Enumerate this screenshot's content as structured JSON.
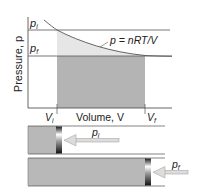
{
  "diagram": {
    "y_axis_label": "Pressure, p",
    "x_axis_label": "Volume, V",
    "pressure_initial_label": {
      "main": "p",
      "sub": "i"
    },
    "pressure_final_label": {
      "main": "p",
      "sub": "f"
    },
    "volume_initial_label": {
      "main": "V",
      "sub": "i"
    },
    "volume_final_label": {
      "main": "V",
      "sub": "f"
    },
    "curve_label": "p = nRT/V",
    "piston_initial_pressure_label": {
      "main": "p",
      "sub": "i"
    },
    "piston_final_pressure_label": {
      "main": "p",
      "sub": "f"
    },
    "colors": {
      "axis": "#555555",
      "curve": "#555555",
      "light_shade": "#e6e6e6",
      "dark_shade": "#b4b4b4",
      "gas": "#b8b8b8",
      "arrow": "#d8d8d8"
    }
  }
}
